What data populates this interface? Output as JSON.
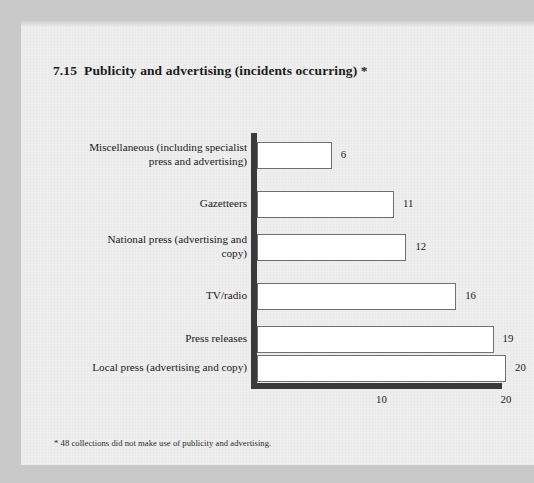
{
  "figure": {
    "number": "7.15",
    "title": "Publicity and advertising (incidents occurring) *",
    "footnote": "* 48 collections did not make use of publicity and advertising."
  },
  "chart_data": {
    "type": "bar",
    "orientation": "horizontal",
    "xlabel": "",
    "ylabel": "",
    "xlim": [
      0,
      20
    ],
    "grid": false,
    "legend": null,
    "xticks": [
      "10",
      "20"
    ],
    "xtick_values": [
      10,
      20
    ],
    "categories": [
      "Miscellaneous (including specialist press and advertising)",
      "Gazetteers",
      "National press (advertising and copy)",
      "TV/radio",
      "Press releases",
      "Local press (advertising and copy)"
    ],
    "values": [
      6,
      11,
      12,
      16,
      19,
      20
    ],
    "data_labels": [
      "6",
      "11",
      "12",
      "16",
      "19",
      "20"
    ],
    "notes": "* 48 collections did not make use of publicity and advertising.",
    "colors": {
      "bar_fill": "#ffffff",
      "bar_stroke": "#6f6f6f",
      "axis": "#3a3a3a",
      "text": "#1a1a1a",
      "page": "#eeeeee",
      "margin": "#c9c9c9"
    }
  },
  "category_lines": [
    [
      "Miscellaneous (including specialist",
      "press and advertising)"
    ],
    [
      "Gazetteers"
    ],
    [
      "National press (advertising and",
      "copy)"
    ],
    [
      "TV/radio"
    ],
    [
      "Press releases"
    ],
    [
      "Local press (advertising and copy)"
    ]
  ]
}
